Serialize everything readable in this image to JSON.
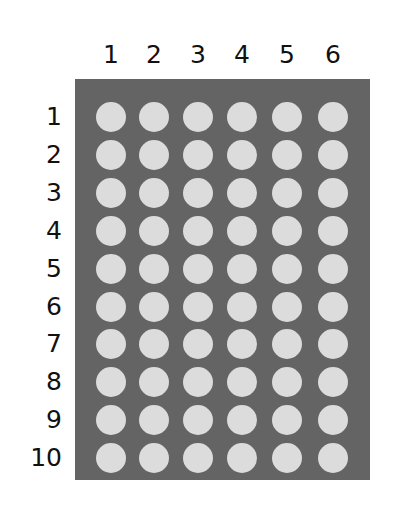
{
  "grid": {
    "columns": [
      "1",
      "2",
      "3",
      "4",
      "5",
      "6"
    ],
    "rows": [
      "1",
      "2",
      "3",
      "4",
      "5",
      "6",
      "7",
      "8",
      "9",
      "10"
    ],
    "panel_color": "#646464",
    "dot_color": "#dcdcdc"
  }
}
